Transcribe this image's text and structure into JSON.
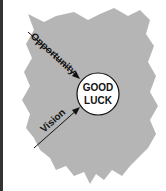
{
  "diagram": {
    "center_label_line1": "GOOD",
    "center_label_line2": "LUCK",
    "arrows": [
      {
        "label": "Opportunity"
      },
      {
        "label": "Vision"
      }
    ],
    "colors": {
      "region": "#b5b5b5",
      "circle": "#ffffff",
      "stroke": "#111111",
      "border": "#333333"
    }
  }
}
